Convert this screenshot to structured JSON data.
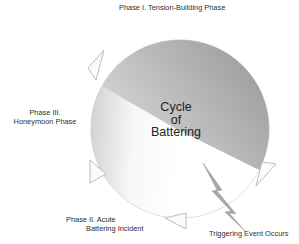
{
  "diagram": {
    "title": "Cycle of Battering",
    "center": {
      "line1": "Cycle",
      "line2": "of",
      "line3": "Battering"
    },
    "phases": [
      {
        "id": "phase-1",
        "label": "Phase I. Tension-Building Phase"
      },
      {
        "id": "phase-2",
        "label_line1": "Phase II. Acute",
        "label_line2": "Battering Incident"
      },
      {
        "id": "phase-3",
        "label_line1": "Phase III.",
        "label_line2": "Honeymoon Phase"
      }
    ],
    "event": {
      "label": "Triggering Event Occurs",
      "icon": "lightning-bolt-icon"
    },
    "colors": {
      "phase1_dark": "#8f8f8f",
      "phase1_light": "#d2d2d2",
      "phase3_dark": "#bdbdbd",
      "phase3_light": "#f4f4f4",
      "phase2_fill": "#ffffff",
      "outline": "#b8b8b8"
    }
  }
}
